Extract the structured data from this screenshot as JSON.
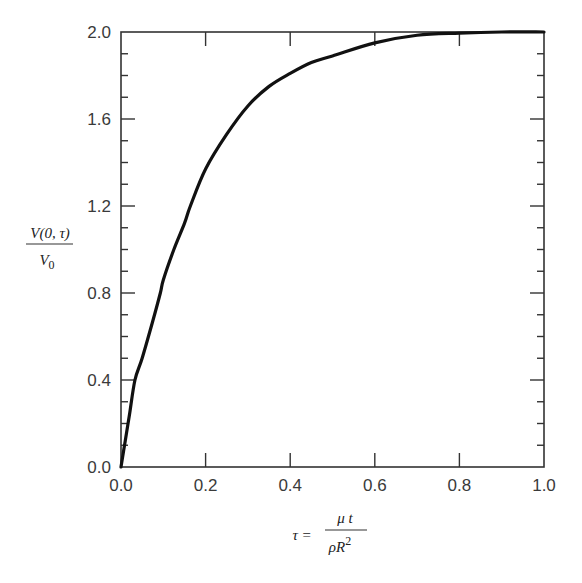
{
  "chart_data": {
    "type": "line",
    "title": "",
    "xlabel": "τ = μt / ρR²",
    "ylabel": "V(0, τ) / V0",
    "xlim": [
      0.0,
      1.0
    ],
    "ylim": [
      0.0,
      2.0
    ],
    "x_ticks": [
      "0.0",
      "0.2",
      "0.4",
      "0.6",
      "0.8",
      "1.0"
    ],
    "y_ticks": [
      "0.0",
      "0.4",
      "0.8",
      "1.2",
      "1.6",
      "2.0"
    ],
    "y_minor_step": 0.1,
    "grid": false,
    "legend": null,
    "series": [
      {
        "name": "V(0,τ)/V0",
        "x": [
          0.0,
          0.01,
          0.02,
          0.033,
          0.05,
          0.075,
          0.093,
          0.1,
          0.125,
          0.15,
          0.164,
          0.2,
          0.25,
          0.3,
          0.35,
          0.4,
          0.45,
          0.5,
          0.6,
          0.7,
          0.8,
          0.9,
          1.0
        ],
        "y": [
          0.0,
          0.12,
          0.24,
          0.4,
          0.5,
          0.67,
          0.8,
          0.86,
          1.0,
          1.12,
          1.2,
          1.37,
          1.53,
          1.66,
          1.75,
          1.81,
          1.86,
          1.89,
          1.95,
          1.985,
          1.995,
          2.0,
          2.0
        ]
      }
    ]
  },
  "labels": {
    "y_num": "V(0, τ)",
    "y_den": "V",
    "y_den_sub": "0",
    "x_lhs": "τ =",
    "x_num": "μ t",
    "x_den": "ρR",
    "x_den_sup": "2"
  }
}
